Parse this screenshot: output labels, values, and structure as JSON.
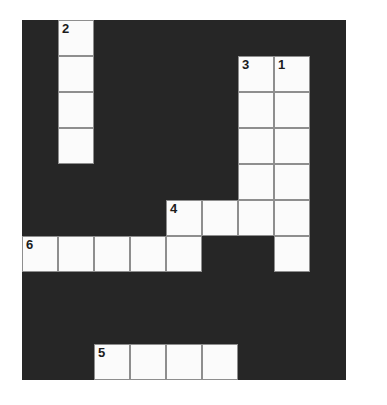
{
  "page": {
    "background_color": "#ffffff"
  },
  "board": {
    "name": "crossword-grid",
    "columns": 9,
    "rows": 10,
    "cell_size_px": 36,
    "origin_x_px": 22,
    "origin_y_px": 20,
    "block_color": "#262626",
    "cell_fill_color": "#fbfbfb",
    "cell_border_color": "#8e8e8e",
    "number_color": "#1c1c1c"
  },
  "entries": [
    {
      "number": "1",
      "direction": "down",
      "length": 6,
      "start_col": 7,
      "start_row": 1,
      "letters": [
        "",
        "",
        "",
        "",
        "",
        ""
      ]
    },
    {
      "number": "2",
      "direction": "down",
      "length": 4,
      "start_col": 1,
      "start_row": 0,
      "letters": [
        "",
        "",
        "",
        ""
      ]
    },
    {
      "number": "3",
      "direction": "down",
      "length": 5,
      "start_col": 6,
      "start_row": 1,
      "letters": [
        "",
        "",
        "",
        "",
        ""
      ]
    },
    {
      "number": "4",
      "direction": "across",
      "length": 4,
      "start_col": 4,
      "start_row": 5,
      "letters": [
        "",
        "",
        "",
        ""
      ]
    },
    {
      "number": "5",
      "direction": "across",
      "length": 4,
      "start_col": 2,
      "start_row": 9,
      "letters": [
        "",
        "",
        "",
        ""
      ]
    },
    {
      "number": "6",
      "direction": "across",
      "length": 5,
      "start_col": 0,
      "start_row": 6,
      "letters": [
        "",
        "",
        "",
        "",
        ""
      ]
    }
  ],
  "cells": [
    {
      "col": 1,
      "row": 0,
      "number": "2"
    },
    {
      "col": 1,
      "row": 1,
      "number": ""
    },
    {
      "col": 1,
      "row": 2,
      "number": ""
    },
    {
      "col": 1,
      "row": 3,
      "number": ""
    },
    {
      "col": 6,
      "row": 1,
      "number": "3"
    },
    {
      "col": 7,
      "row": 1,
      "number": "1"
    },
    {
      "col": 6,
      "row": 2,
      "number": ""
    },
    {
      "col": 7,
      "row": 2,
      "number": ""
    },
    {
      "col": 6,
      "row": 3,
      "number": ""
    },
    {
      "col": 7,
      "row": 3,
      "number": ""
    },
    {
      "col": 6,
      "row": 4,
      "number": ""
    },
    {
      "col": 7,
      "row": 4,
      "number": ""
    },
    {
      "col": 4,
      "row": 5,
      "number": "4"
    },
    {
      "col": 5,
      "row": 5,
      "number": ""
    },
    {
      "col": 6,
      "row": 5,
      "number": ""
    },
    {
      "col": 7,
      "row": 5,
      "number": ""
    },
    {
      "col": 0,
      "row": 6,
      "number": "6"
    },
    {
      "col": 1,
      "row": 6,
      "number": ""
    },
    {
      "col": 2,
      "row": 6,
      "number": ""
    },
    {
      "col": 3,
      "row": 6,
      "number": ""
    },
    {
      "col": 4,
      "row": 6,
      "number": ""
    },
    {
      "col": 7,
      "row": 6,
      "number": ""
    },
    {
      "col": 2,
      "row": 9,
      "number": "5"
    },
    {
      "col": 3,
      "row": 9,
      "number": ""
    },
    {
      "col": 4,
      "row": 9,
      "number": ""
    },
    {
      "col": 5,
      "row": 9,
      "number": ""
    }
  ]
}
